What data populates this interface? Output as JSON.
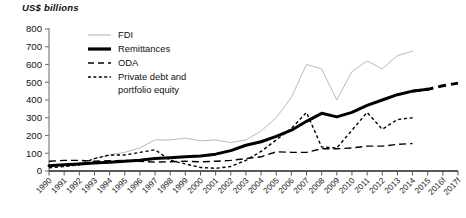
{
  "axis_title": "US$ billions",
  "legend": {
    "items": [
      {
        "label": "FDI",
        "style": "thin-solid-gray",
        "color": "#b9b9b9"
      },
      {
        "label": "Remittances",
        "style": "thick-solid-black",
        "color": "#000000"
      },
      {
        "label": "ODA",
        "style": "long-dash-black",
        "color": "#000000"
      },
      {
        "label": "Private debt and",
        "label2": "portfolio equity",
        "style": "short-dash-black",
        "color": "#000000"
      }
    ]
  },
  "chart_data": {
    "type": "line",
    "title": "US$ billions",
    "xlabel": "",
    "ylabel": "US$ billions",
    "ylim": [
      0,
      800
    ],
    "yticks": [
      0,
      100,
      200,
      300,
      400,
      500,
      600,
      700,
      800
    ],
    "grid": false,
    "legend_position": "top-left-inside",
    "categories": [
      "1990",
      "1991",
      "1992",
      "1993",
      "1994",
      "1995",
      "1996",
      "1997",
      "1998",
      "1999",
      "2000",
      "2001",
      "2002",
      "2003",
      "2004",
      "2005",
      "2006",
      "2007",
      "2008",
      "2009",
      "2010",
      "2011",
      "2012",
      "2013",
      "2014",
      "2015",
      "2016f",
      "2017f"
    ],
    "series": [
      {
        "name": "FDI",
        "color": "#b9b9b9",
        "style": "solid",
        "width": 1,
        "values": [
          25,
          35,
          45,
          70,
          90,
          105,
          130,
          175,
          175,
          185,
          170,
          175,
          160,
          175,
          225,
          300,
          415,
          600,
          575,
          400,
          560,
          620,
          575,
          650,
          675,
          null,
          null,
          null
        ]
      },
      {
        "name": "Remittances",
        "color": "#000000",
        "style": "solid",
        "width": 3,
        "values": [
          30,
          35,
          40,
          45,
          50,
          55,
          60,
          70,
          75,
          80,
          85,
          95,
          115,
          145,
          165,
          195,
          230,
          280,
          325,
          305,
          330,
          370,
          400,
          430,
          450,
          460,
          null,
          null
        ]
      },
      {
        "name": "Remittances (forecast)",
        "color": "#000000",
        "style": "thick-dash",
        "width": 3,
        "values": [
          null,
          null,
          null,
          null,
          null,
          null,
          null,
          null,
          null,
          null,
          null,
          null,
          null,
          null,
          null,
          null,
          null,
          null,
          null,
          null,
          null,
          null,
          null,
          null,
          450,
          460,
          480,
          495
        ]
      },
      {
        "name": "ODA",
        "color": "#000000",
        "style": "long-dash",
        "width": 1.4,
        "values": [
          55,
          60,
          60,
          55,
          58,
          60,
          55,
          50,
          52,
          55,
          52,
          55,
          60,
          70,
          80,
          108,
          105,
          105,
          125,
          125,
          130,
          140,
          140,
          150,
          155,
          null,
          null,
          null
        ]
      },
      {
        "name": "Private debt and portfolio equity",
        "color": "#000000",
        "style": "short-dash",
        "width": 1.4,
        "values": [
          18,
          25,
          35,
          70,
          90,
          90,
          105,
          120,
          60,
          40,
          20,
          15,
          25,
          60,
          110,
          175,
          240,
          330,
          135,
          130,
          230,
          330,
          235,
          290,
          300,
          null,
          null,
          null
        ]
      }
    ]
  }
}
